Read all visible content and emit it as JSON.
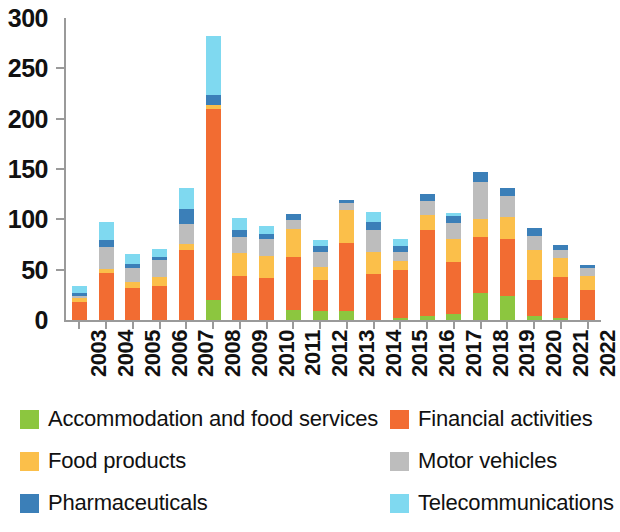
{
  "chart_data": {
    "type": "bar",
    "stacked": true,
    "title": "",
    "subtitle": "",
    "xlabel": "",
    "ylabel": "",
    "ylim": [
      0,
      300
    ],
    "ytick_interval": 50,
    "ytick_labels": [
      "300",
      "250",
      "200",
      "150",
      "100",
      "50",
      "0"
    ],
    "ytick_values": [
      300,
      250,
      200,
      150,
      100,
      50,
      0
    ],
    "grid": false,
    "legend_position": "bottom",
    "categories": [
      "2003",
      "2004",
      "2005",
      "2006",
      "2007",
      "2008",
      "2009",
      "2010",
      "2011",
      "2012",
      "2013",
      "2014",
      "2015",
      "2016",
      "2017",
      "2018",
      "2019",
      "2020",
      "2021",
      "2022"
    ],
    "series": [
      {
        "name": "Accommodation and food services",
        "color": "#8CC63F",
        "values": [
          0,
          0,
          0,
          0,
          0,
          20,
          0,
          0,
          10,
          9,
          9,
          0,
          2,
          4,
          6,
          27,
          24,
          4,
          2,
          0
        ]
      },
      {
        "name": "Financial activities",
        "color": "#F26C32",
        "values": [
          18,
          47,
          32,
          34,
          70,
          190,
          44,
          42,
          53,
          31,
          68,
          46,
          48,
          85,
          52,
          55,
          56,
          36,
          41,
          30
        ]
      },
      {
        "name": "Food products",
        "color": "#FBBF4A",
        "values": [
          4,
          4,
          6,
          9,
          6,
          4,
          23,
          22,
          27,
          13,
          32,
          22,
          9,
          15,
          22,
          18,
          22,
          30,
          19,
          14
        ]
      },
      {
        "name": "Motor vehicles",
        "color": "#BDBDBD",
        "values": [
          2,
          22,
          14,
          17,
          19,
          0,
          15,
          16,
          9,
          15,
          7,
          21,
          9,
          14,
          16,
          37,
          21,
          13,
          8,
          8
        ]
      },
      {
        "name": "Pharmaceuticals",
        "color": "#3B7FB8",
        "values": [
          3,
          6,
          4,
          3,
          15,
          10,
          7,
          5,
          6,
          6,
          3,
          8,
          6,
          7,
          7,
          10,
          8,
          8,
          5,
          3
        ]
      },
      {
        "name": "Telecommunications",
        "color": "#7FD9F0",
        "values": [
          7,
          18,
          10,
          8,
          21,
          58,
          12,
          8,
          0,
          5,
          0,
          10,
          6,
          0,
          3,
          0,
          0,
          0,
          0,
          0
        ]
      }
    ],
    "totals": [
      34,
      97,
      66,
      71,
      131,
      282,
      101,
      93,
      105,
      79,
      119,
      107,
      80,
      125,
      106,
      147,
      131,
      91,
      75,
      55
    ]
  },
  "legend": {
    "left_items": [
      {
        "label": "Accommodation and food services",
        "color": "#8CC63F"
      },
      {
        "label": "Food products",
        "color": "#FBBF4A"
      },
      {
        "label": "Pharmaceuticals",
        "color": "#3B7FB8"
      }
    ],
    "right_items": [
      {
        "label": "Financial activities",
        "color": "#F26C32"
      },
      {
        "label": "Motor vehicles",
        "color": "#BDBDBD"
      },
      {
        "label": "Telecommunications",
        "color": "#7FD9F0"
      }
    ]
  }
}
